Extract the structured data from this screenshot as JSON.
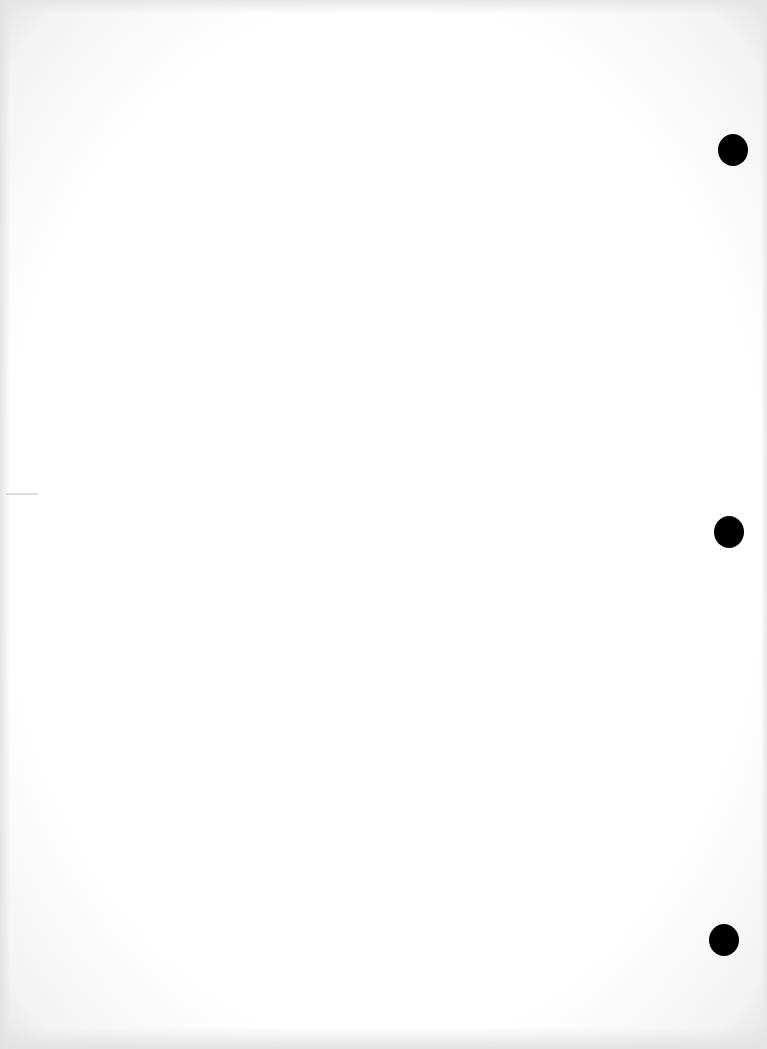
{
  "document": {
    "type": "blank scanned page",
    "background_color": "#ffffff",
    "border_tint": "#e4e4e4",
    "punch_holes": [
      {
        "cx": 733,
        "cy": 150
      },
      {
        "cx": 729,
        "cy": 532
      },
      {
        "cx": 724,
        "cy": 940
      }
    ],
    "punch_hole_color": "#000000"
  }
}
